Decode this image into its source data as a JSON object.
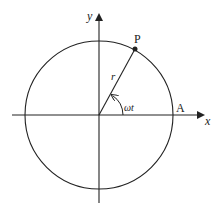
{
  "diagram": {
    "title": "",
    "colors": {
      "stroke": "#222222",
      "background": "#ffffff"
    },
    "axes": {
      "x_label": "x",
      "y_label": "y"
    },
    "circle": {
      "center": [
        99,
        115
      ],
      "radius": 74
    },
    "points": [
      {
        "id": "P",
        "label": "P",
        "position": [
          135,
          49
        ]
      },
      {
        "id": "A",
        "label": "A",
        "position": [
          173,
          115
        ]
      }
    ],
    "radius_label": "r",
    "angle_label": "ωt"
  }
}
